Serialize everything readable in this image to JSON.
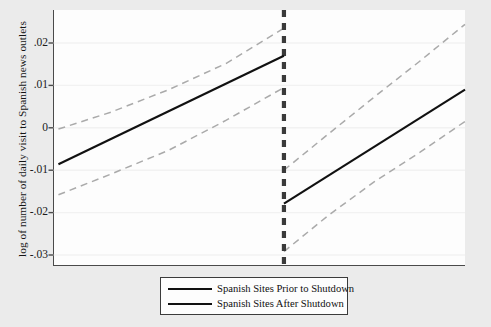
{
  "chart_data": {
    "type": "line",
    "title": "",
    "subtitle": "",
    "xlabel": "",
    "ylabel": "log of number of daily visit to Spanish news outlets",
    "ylim": [
      -0.03,
      0.025
    ],
    "yticks": [
      0.02,
      0.01,
      0,
      -0.01,
      -0.02,
      -0.03
    ],
    "ytick_labels": [
      ".02",
      ".01",
      "0",
      "-.01",
      "-.02",
      "-.03"
    ],
    "xlim": [
      0,
      100
    ],
    "xticks": [],
    "xtick_labels": [],
    "grid": true,
    "grid_axis": "y",
    "legend_position": "bottom-outside",
    "discontinuity": {
      "label": "shutdown",
      "x": 56,
      "style": "dashed-vertical",
      "color": "#3a3a3a"
    },
    "series": [
      {
        "name": "Spanish Sites Prior to Shutdown",
        "style": "solid",
        "color": "#111111",
        "x": [
          1.2,
          56
        ],
        "values": [
          -0.0086,
          0.017
        ],
        "ci_upper": {
          "x": [
            1.2,
            14,
            28,
            42,
            56
          ],
          "values": [
            -0.0003,
            0.0037,
            0.009,
            0.0152,
            0.0235
          ]
        },
        "ci_lower": {
          "x": [
            1.2,
            14,
            28,
            42,
            56
          ],
          "values": [
            -0.0158,
            -0.0109,
            -0.0053,
            0.0018,
            0.0095
          ]
        }
      },
      {
        "name": "Spanish Sites After Shutdown",
        "style": "solid",
        "color": "#111111",
        "x": [
          56,
          100
        ],
        "values": [
          -0.0179,
          0.009
        ],
        "ci_upper": {
          "x": [
            56,
            67,
            78,
            89,
            100
          ],
          "values": [
            -0.01,
            -0.0013,
            0.0073,
            0.0157,
            0.0244
          ]
        },
        "ci_lower": {
          "x": [
            56,
            67,
            78,
            89,
            100
          ],
          "values": [
            -0.0292,
            -0.0205,
            -0.0127,
            -0.0058,
            0.0015
          ]
        }
      }
    ],
    "ci_style": {
      "style": "dashed",
      "color": "#aaaaaa",
      "note": "95% confidence interval bands"
    }
  },
  "legend": {
    "items": [
      {
        "label": "Spanish Sites Prior to Shutdown",
        "color": "#111111"
      },
      {
        "label": "Spanish Sites After Shutdown",
        "color": "#111111"
      }
    ]
  },
  "axes": {
    "y_title": "log of number of daily visit to Spanish news outlets",
    "y_tick_0": ".02",
    "y_tick_1": ".01",
    "y_tick_2": "0",
    "y_tick_3": "-.01",
    "y_tick_4": "-.02",
    "y_tick_5": "-.03"
  }
}
